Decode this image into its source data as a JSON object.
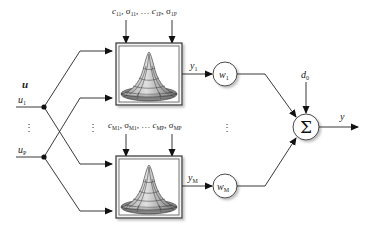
{
  "diagram": {
    "type": "RBF neural network block diagram",
    "input": {
      "vector_label": "u",
      "inputs": [
        {
          "label": "u",
          "subscript": "1"
        },
        {
          "label": "u",
          "subscript": "P"
        }
      ],
      "ellipsis": "⋮"
    },
    "rbf_units": [
      {
        "name": "unit-1",
        "params_label": "c11, σ11, … c1P, σ1P",
        "params": {
          "c": "c",
          "c_sub_first": "11",
          "s_sub_first": "11",
          "c_sub_last": "1P",
          "s_sub_last": "1P",
          "sigma": "σ",
          "dots": "…"
        },
        "output": {
          "label": "y",
          "subscript": "1"
        },
        "weight": {
          "label": "w",
          "subscript": "1"
        }
      },
      {
        "name": "unit-M",
        "params_label": "cM1, σM1, … cMP, σMP",
        "params": {
          "c": "c",
          "c_sub_first": "M1",
          "s_sub_first": "M1",
          "c_sub_last": "MP",
          "s_sub_last": "MP",
          "sigma": "σ",
          "dots": "…"
        },
        "output": {
          "label": "y",
          "subscript": "M"
        },
        "weight": {
          "label": "w",
          "subscript": "M"
        }
      }
    ],
    "middle_ellipsis": "⋮",
    "summation": {
      "symbol": "Σ",
      "bias": {
        "label": "d",
        "subscript": "0"
      }
    },
    "output": {
      "label": "y"
    }
  }
}
